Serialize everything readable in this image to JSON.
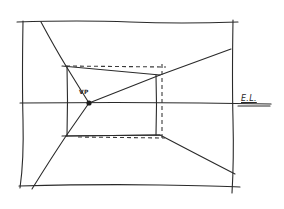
{
  "diagram": {
    "type": "one-point perspective sketch",
    "labels": {
      "vanishing_point": "VP",
      "eye_level": "E.L."
    },
    "colors": {
      "ink": "#2a2a2a",
      "paper": "#ffffff"
    }
  }
}
